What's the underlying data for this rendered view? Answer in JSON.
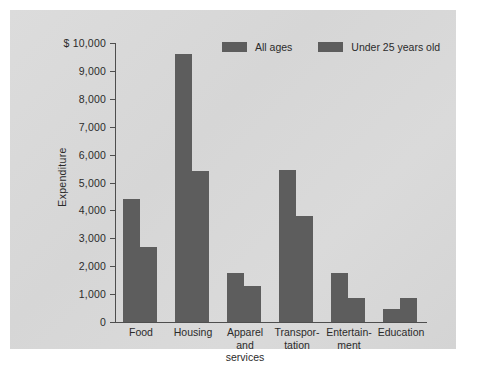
{
  "chart_data": {
    "type": "bar",
    "title": "",
    "xlabel": "",
    "ylabel": "Expenditure",
    "currency_prefix": "$",
    "ylim": [
      0,
      10000
    ],
    "ytick_step": 1000,
    "ytick_labels": [
      "$ 10,000",
      "9,000",
      "8,000",
      "7,000",
      "6,000",
      "5,000",
      "4,000",
      "3,000",
      "2,000",
      "1,000",
      "0"
    ],
    "ytick_values": [
      10000,
      9000,
      8000,
      7000,
      6000,
      5000,
      4000,
      3000,
      2000,
      1000,
      0
    ],
    "grid": false,
    "legend_position": "top-right",
    "categories": [
      "Food",
      "Housing",
      "Apparel\nand\nservices",
      "Transpor-\ntation",
      "Entertain-\nment",
      "Education"
    ],
    "series": [
      {
        "name": "All ages",
        "color": "#5d5d5d",
        "values": [
          4400,
          9600,
          1750,
          5450,
          1750,
          450
        ]
      },
      {
        "name": "Under 25 years old",
        "color": "#5d5d5d",
        "values": [
          2700,
          5400,
          1300,
          3800,
          850,
          850
        ]
      }
    ]
  },
  "legend": {
    "items": [
      {
        "label": "All ages"
      },
      {
        "label": "Under 25 years old"
      }
    ]
  }
}
